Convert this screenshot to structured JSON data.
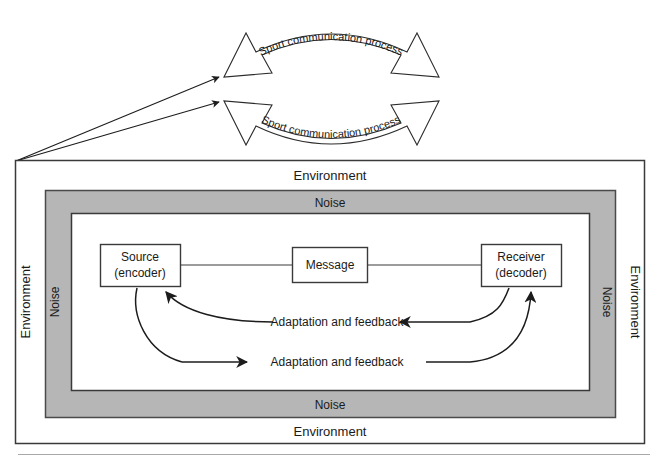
{
  "figure": {
    "colors": {
      "noise_band": "#b6b6b6",
      "background": "#ffffff",
      "stroke": "#3a3a3a",
      "text": "#1a1a1a"
    }
  },
  "top_arcs": {
    "upper_label": "Sport communication process",
    "lower_label": "Sport communication process"
  },
  "frames": {
    "environment_top": "Environment",
    "environment_bottom": "Environment",
    "environment_left": "Environment",
    "environment_right": "Environment",
    "noise_top": "Noise",
    "noise_bottom": "Noise",
    "noise_left": "Noise",
    "noise_right": "Noise"
  },
  "nodes": [
    {
      "id": "source",
      "line1": "Source",
      "line2": "(encoder)"
    },
    {
      "id": "message",
      "line1": "Message",
      "line2": ""
    },
    {
      "id": "receiver",
      "line1": "Receiver",
      "line2": "(decoder)"
    }
  ],
  "feedback": {
    "upper_label": "Adaptation and feedback",
    "lower_label": "Adaptation and feedback"
  }
}
